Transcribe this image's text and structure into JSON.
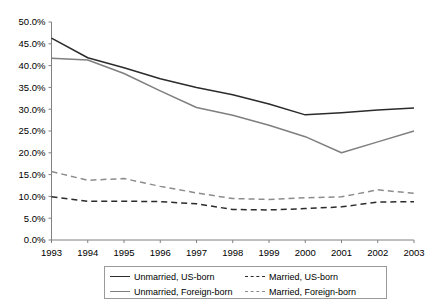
{
  "chart_data": {
    "type": "line",
    "title": "",
    "subtitle": "",
    "xlabel": "",
    "ylabel": "",
    "grid": false,
    "legend_position": "bottom",
    "x": [
      "1993",
      "1994",
      "1995",
      "1996",
      "1997",
      "1998",
      "1999",
      "2000",
      "2001",
      "2002",
      "2003"
    ],
    "categories": [
      "1993",
      "1994",
      "1995",
      "1996",
      "1997",
      "1998",
      "1999",
      "2000",
      "2001",
      "2002",
      "2003"
    ],
    "ylim": [
      0,
      50
    ],
    "ytick_values": [
      0,
      5,
      10,
      15,
      20,
      25,
      30,
      35,
      40,
      45,
      50
    ],
    "ytick_labels": [
      "0.0%",
      "5.0%",
      "10.0%",
      "15.0%",
      "20.0%",
      "25.0%",
      "30.0%",
      "35.0%",
      "40.0%",
      "45.0%",
      "50.0%"
    ],
    "xtick_labels": [
      "1993",
      "1994",
      "1995",
      "1996",
      "1997",
      "1998",
      "1999",
      "2000",
      "2001",
      "2002",
      "2003"
    ],
    "series": [
      {
        "name": "Unmarried, US-born",
        "style": "solid",
        "color": "#2b2b2b",
        "values": [
          46.3,
          41.8,
          39.5,
          37.0,
          35.0,
          33.3,
          31.2,
          28.7,
          29.2,
          29.8,
          30.3
        ]
      },
      {
        "name": "Unmarried, Foreign-born",
        "style": "solid",
        "color": "#7f7f7f",
        "values": [
          41.7,
          41.3,
          38.2,
          34.2,
          30.4,
          28.6,
          26.3,
          23.7,
          20.0,
          22.5,
          25.0
        ]
      },
      {
        "name": "Married, US-born",
        "style": "dashed",
        "color": "#2b2b2b",
        "values": [
          9.9,
          8.9,
          8.9,
          8.8,
          8.3,
          7.0,
          6.9,
          7.2,
          7.6,
          8.7,
          8.8
        ]
      },
      {
        "name": "Married, Foreign-born",
        "style": "dashed",
        "color": "#8c8c8c",
        "values": [
          15.7,
          13.7,
          14.1,
          12.3,
          10.8,
          9.5,
          9.3,
          9.7,
          9.9,
          11.5,
          10.7
        ]
      }
    ]
  },
  "legend": {
    "entries": [
      {
        "label": "Unmarried, US-born"
      },
      {
        "label": "Married, US-born"
      },
      {
        "label": "Unmarried, Foreign-born"
      },
      {
        "label": "Married, Foreign-born"
      }
    ]
  },
  "axes": {
    "axis_color": "#808080",
    "tick_color": "#808080"
  }
}
